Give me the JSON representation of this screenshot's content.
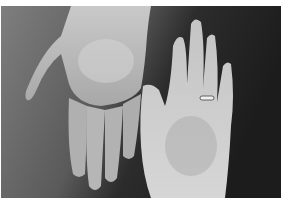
{
  "image": {
    "description": "Grayscale photograph of two open hands, palms facing the camera, against a dark textured wall",
    "colors": {
      "border": "#ffffff",
      "background_light": "#7a7a7a",
      "background_dark": "#1e1e1e",
      "skin_light": "#d0d0d0",
      "skin_mid": "#b4b4b4",
      "skin_shadow": "#8c8c8c",
      "ring": "#f0f0f0"
    },
    "subjects": [
      {
        "name": "left-hand",
        "orientation": "fingers pointing down"
      },
      {
        "name": "right-hand",
        "orientation": "fingers pointing up",
        "accessory": "ring on ring finger"
      }
    ]
  }
}
